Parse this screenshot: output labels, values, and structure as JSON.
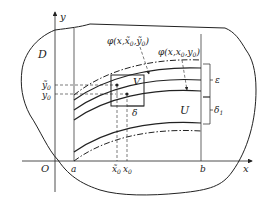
{
  "diagram": {
    "region_label": "D",
    "axes": {
      "x_label": "x",
      "y_label": "y",
      "origin_label": "O"
    },
    "x_ticks": [
      {
        "label": "a"
      },
      {
        "label": "x̃",
        "sub": "0"
      },
      {
        "label": "x",
        "sub": "0"
      },
      {
        "label": "b"
      }
    ],
    "y_ticks": [
      {
        "label": "ỹ",
        "sub": "0"
      },
      {
        "label": "y",
        "sub": "0"
      }
    ],
    "curve_labels": {
      "tilde": {
        "text": "φ(x,x̃",
        "sub1": "0",
        "mid": ",ỹ",
        "sub2": "0",
        "end": ")"
      },
      "main": {
        "text": "φ(x,x",
        "sub1": "0",
        "mid": ",y",
        "sub2": "0",
        "end": ")"
      }
    },
    "box_label": "V",
    "delta_label": "δ",
    "neighborhood_label": "U",
    "epsilon_label": "ε",
    "delta1_label": "δ",
    "delta1_sub": "1",
    "colors": {
      "stroke": "#222222",
      "background": "#ffffff"
    }
  }
}
